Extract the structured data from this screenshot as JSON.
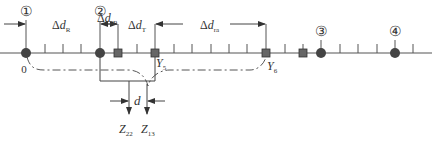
{
  "diagram": {
    "stations": [
      {
        "id": "1",
        "label": "①",
        "x": 26
      },
      {
        "id": "2",
        "label": "②",
        "x": 100
      },
      {
        "id": "3",
        "label": "③",
        "x": 321
      },
      {
        "id": "4",
        "label": "④",
        "x": 395
      }
    ],
    "squares": [
      {
        "x": 118
      },
      {
        "x": 155
      },
      {
        "x": 266
      },
      {
        "x": 303
      }
    ],
    "ticks": [
      45,
      63,
      81,
      137,
      174,
      192,
      211,
      229,
      247,
      285,
      340,
      358,
      377,
      413
    ],
    "origin_label": "0",
    "dimensions": {
      "dR": {
        "delta": "Δ",
        "d": "d",
        "sub": "R"
      },
      "dIR": {
        "delta": "Δ",
        "d": "d",
        "sub": "IR"
      },
      "dT": {
        "delta": "Δ",
        "d": "d",
        "sub": "T"
      },
      "dra": {
        "delta": "Δ",
        "d": "d",
        "sub": "ra"
      }
    },
    "points": {
      "y5": {
        "main": "Y",
        "sub": "5"
      },
      "y6": {
        "main": "Y",
        "sub": "6"
      }
    },
    "d_label": "d",
    "outputs": {
      "z22": {
        "main": "Z",
        "sub": "22"
      },
      "z13": {
        "main": "Z",
        "sub": "13"
      }
    },
    "colors": {
      "line": "#555555",
      "marker": "#444444",
      "text": "#333333"
    }
  }
}
